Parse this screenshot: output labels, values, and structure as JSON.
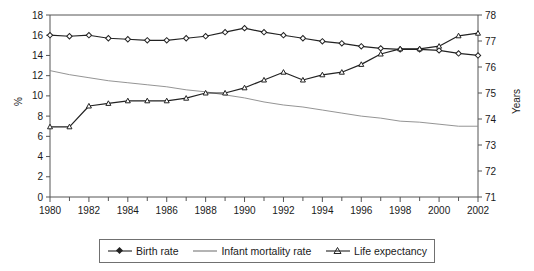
{
  "chart_data": {
    "type": "line",
    "title": "",
    "xlabel": "",
    "ylabel": "%",
    "y2label": "Years",
    "grid": false,
    "legend_position": "bottom",
    "x": [
      1980,
      1981,
      1982,
      1983,
      1984,
      1985,
      1986,
      1987,
      1988,
      1989,
      1990,
      1991,
      1992,
      1993,
      1994,
      1995,
      1996,
      1997,
      1998,
      1999,
      2000,
      2001,
      2002
    ],
    "xlim": [
      1980,
      2002
    ],
    "xticks": [
      1980,
      1982,
      1984,
      1986,
      1988,
      1990,
      1992,
      1994,
      1996,
      1998,
      2000,
      2002
    ],
    "xminorticks": [
      1981,
      1983,
      1985,
      1987,
      1989,
      1991,
      1993,
      1995,
      1997,
      1999,
      2001
    ],
    "ylim": [
      0,
      18
    ],
    "yticks": [
      0,
      2,
      4,
      6,
      8,
      10,
      12,
      14,
      16,
      18
    ],
    "y2lim": [
      71,
      78
    ],
    "y2ticks": [
      71,
      72,
      73,
      74,
      75,
      76,
      77,
      78
    ],
    "series": [
      {
        "name": "Birth rate",
        "axis": "left",
        "marker": "diamond",
        "color": "#222222",
        "values": [
          16.0,
          15.9,
          16.0,
          15.7,
          15.6,
          15.5,
          15.5,
          15.7,
          15.9,
          16.3,
          16.7,
          16.3,
          16.0,
          15.7,
          15.4,
          15.2,
          14.9,
          14.7,
          14.6,
          14.6,
          14.5,
          14.2,
          14.0
        ]
      },
      {
        "name": "Infant mortality rate",
        "axis": "left",
        "marker": "none",
        "color": "#888888",
        "values": [
          12.5,
          12.1,
          11.8,
          11.5,
          11.3,
          11.1,
          10.9,
          10.6,
          10.4,
          10.1,
          9.8,
          9.4,
          9.1,
          8.9,
          8.6,
          8.3,
          8.0,
          7.8,
          7.5,
          7.4,
          7.2,
          7.0,
          7.0
        ]
      },
      {
        "name": "Life expectancy",
        "axis": "right",
        "marker": "triangle",
        "color": "#222222",
        "values": [
          73.7,
          73.7,
          74.5,
          74.6,
          74.7,
          74.7,
          74.7,
          74.8,
          75.0,
          75.0,
          75.2,
          75.5,
          75.8,
          75.5,
          75.7,
          75.8,
          76.1,
          76.5,
          76.7,
          76.7,
          76.8,
          77.2,
          77.3
        ]
      }
    ]
  },
  "axes": {
    "left_title": "%",
    "right_title": "Years"
  },
  "legend": {
    "items": [
      {
        "label": "Birth rate",
        "marker": "diamond"
      },
      {
        "label": "Infant mortality rate",
        "marker": "none"
      },
      {
        "label": "Life expectancy",
        "marker": "triangle"
      }
    ]
  }
}
